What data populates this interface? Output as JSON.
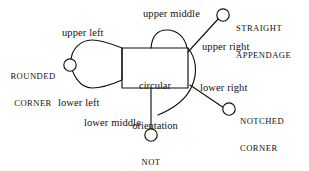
{
  "diagram": {
    "style": {
      "stroke_color": "#111111",
      "background": "#ffffff",
      "node_fill": "#ffffff"
    },
    "center_node": {
      "label_line_1": "circular",
      "label_line_2": "orientation"
    },
    "part_labels": [
      {
        "key": "upper_left",
        "text": "upper left"
      },
      {
        "key": "upper_middle",
        "text": "upper middle"
      },
      {
        "key": "upper_right",
        "text": "upper right"
      },
      {
        "key": "lower_left",
        "text": "lower left"
      },
      {
        "key": "lower_middle",
        "text": "lower middle"
      },
      {
        "key": "lower_right",
        "text": "lower right"
      }
    ],
    "property_labels": [
      {
        "key": "rounded_corner",
        "line_1": "ROUNDED",
        "line_2": "CORNER"
      },
      {
        "key": "straight_appendage",
        "line_1": "STRAIGHT",
        "line_2": "APPENDAGE"
      },
      {
        "key": "notched_corner",
        "line_1": "NOTCHED",
        "line_2": "CORNER"
      },
      {
        "key": "not_concave",
        "line_1": "NOT",
        "line_2": "CONCAVE"
      }
    ]
  }
}
